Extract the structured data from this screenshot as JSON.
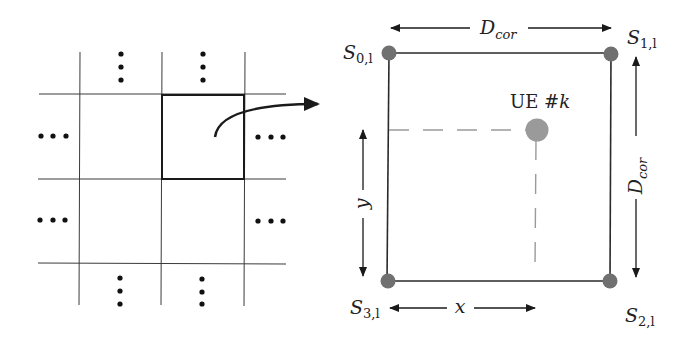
{
  "figure": {
    "left_panel": {
      "description": "Grid of cells with one highlighted cell expanded on the right",
      "ellipsis_symbol": "•"
    },
    "right_panel": {
      "corners": [
        {
          "id": "s0",
          "base": "S",
          "sub": "0,l",
          "position": "top-left"
        },
        {
          "id": "s1",
          "base": "S",
          "sub": "1,l",
          "position": "top-right"
        },
        {
          "id": "s2",
          "base": "S",
          "sub": "2,l",
          "position": "bottom-right"
        },
        {
          "id": "s3",
          "base": "S",
          "sub": "3,l",
          "position": "bottom-left"
        }
      ],
      "ue_label_prefix": "UE #",
      "ue_label_var": "k",
      "dimension_top": {
        "base": "D",
        "sub": "cor"
      },
      "dimension_right": {
        "base": "D",
        "sub": "cor"
      },
      "x_label": "x",
      "y_label": "y"
    },
    "colors": {
      "line": "#2a2a2a",
      "node": "#707070",
      "ue_node": "#9a9a9a",
      "dashed": "#9a9a9a"
    }
  }
}
